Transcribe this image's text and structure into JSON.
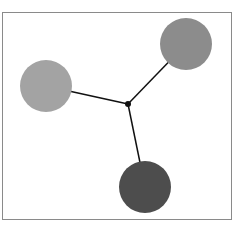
{
  "diagram": {
    "type": "star-network",
    "frame": {
      "x": 2,
      "y": 12,
      "width": 229,
      "height": 207,
      "stroke": "#8a8a8a"
    },
    "hub": {
      "cx": 128,
      "cy": 104,
      "r": 3,
      "fill": "#111111"
    },
    "nodes": [
      {
        "id": "left",
        "cx": 46,
        "cy": 86,
        "r": 26,
        "fill": "#a3a3a3"
      },
      {
        "id": "top-right",
        "cx": 186,
        "cy": 44,
        "r": 26,
        "fill": "#8c8c8c"
      },
      {
        "id": "bottom",
        "cx": 145,
        "cy": 187,
        "r": 26,
        "fill": "#4d4d4d"
      }
    ],
    "edge_color": "#111111"
  }
}
